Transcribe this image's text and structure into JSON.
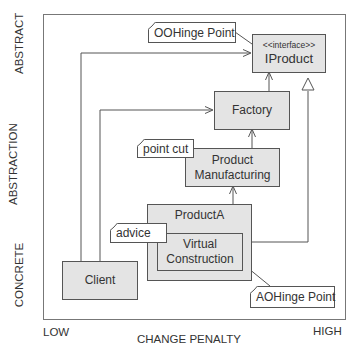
{
  "axes": {
    "y_title": "ABSTRACTION",
    "y_top": "ABSTRACT",
    "y_bottom": "CONCRETE",
    "x_title": "CHANGE PENALTY",
    "x_left": "LOW",
    "x_right": "HIGH"
  },
  "classes": {
    "iproduct": {
      "stereotype": "<<interface>>",
      "name": "IProduct"
    },
    "factory": {
      "name": "Factory"
    },
    "product_manufacturing": {
      "line1": "Product",
      "line2": "Manufacturing"
    },
    "product_a": {
      "name": "ProductA"
    },
    "virtual_construction": {
      "line1": "Virtual",
      "line2": "Construction"
    },
    "client": {
      "name": "Client"
    }
  },
  "notes": {
    "oohinge": "OOHinge Point",
    "point_cut": "point cut",
    "advice": "advice",
    "aohinge": "AOHinge Point"
  },
  "colors": {
    "class_fill": "#e4e4e4",
    "line": "#555555",
    "frame": "#777777"
  }
}
